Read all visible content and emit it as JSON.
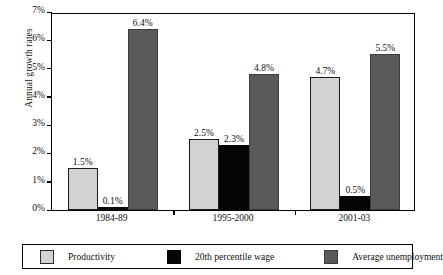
{
  "chart_data": {
    "type": "bar",
    "title": "",
    "xlabel": "",
    "ylabel": "Annual growth rates",
    "ylim": [
      0,
      7
    ],
    "ytick_labels": [
      "0%",
      "1%",
      "2%",
      "3%",
      "4%",
      "5%",
      "6%",
      "7%"
    ],
    "ytick_values": [
      0,
      1,
      2,
      3,
      4,
      5,
      6,
      7
    ],
    "grid": false,
    "legend_position": "bottom",
    "categories": [
      "1984-89",
      "1995-2000",
      "2001-03"
    ],
    "series": [
      {
        "name": "Productivity",
        "color": "#d2d2d2",
        "values": [
          1.5,
          2.5,
          4.7
        ],
        "labels": [
          "1.5%",
          "2.5%",
          "4.7%"
        ]
      },
      {
        "name": "20th percentile wage",
        "color": "#050505",
        "values": [
          0.1,
          2.3,
          0.5
        ],
        "labels": [
          "0.1%",
          "2.3%",
          "0.5%"
        ]
      },
      {
        "name": "Average unemployment",
        "color": "#5a5a5a",
        "values": [
          6.4,
          4.8,
          5.5
        ],
        "labels": [
          "6.4%",
          "4.8%",
          "5.5%"
        ]
      }
    ]
  }
}
